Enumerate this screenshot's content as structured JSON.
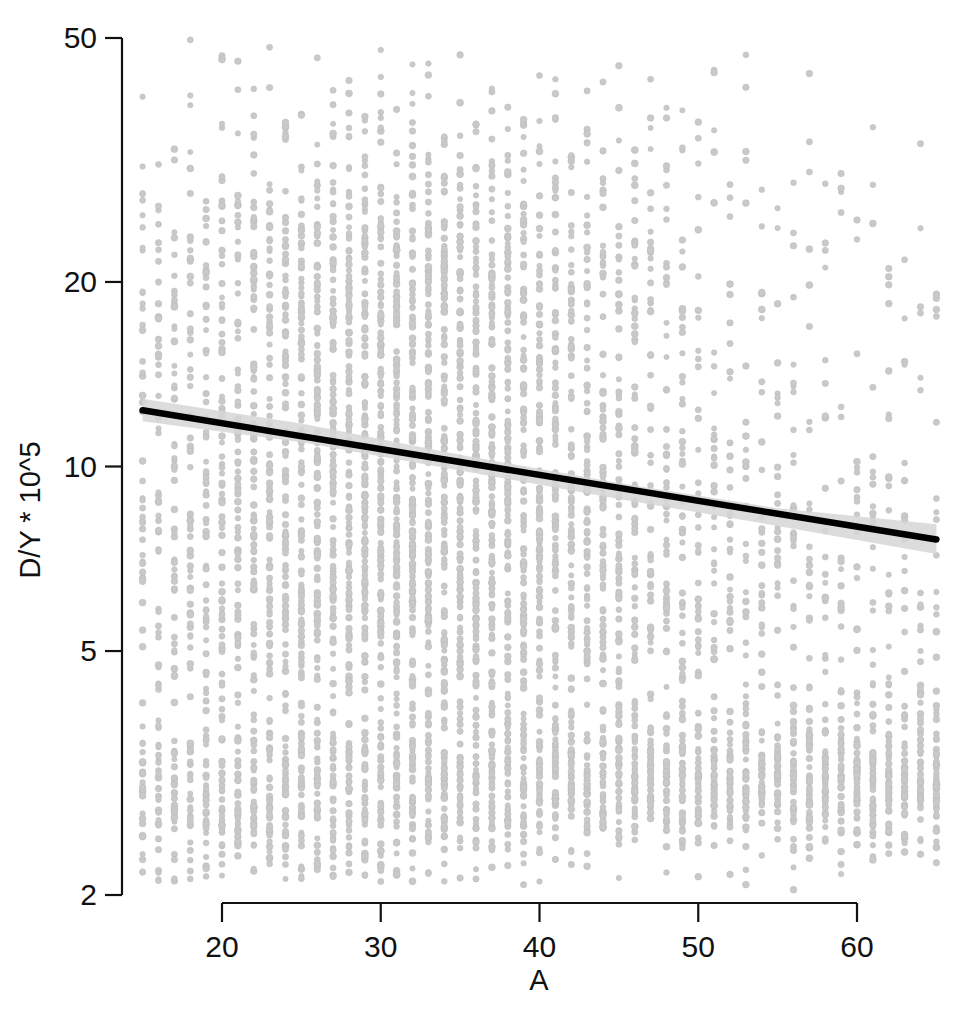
{
  "chart_data": {
    "type": "scatter",
    "title": "",
    "subtitle": "",
    "xlabel": "A",
    "ylabel": "D/Y * 10^5",
    "xscale": "linear",
    "yscale": "log",
    "xlim": [
      14.5,
      65.5
    ],
    "ylim": [
      2,
      50
    ],
    "xticks": [
      20,
      30,
      40,
      50,
      60
    ],
    "xtick_labels": [
      "20",
      "30",
      "40",
      "50",
      "60"
    ],
    "yticks": [
      2,
      5,
      10,
      20,
      50
    ],
    "ytick_labels": [
      "2",
      "5",
      "10",
      "20",
      "50"
    ],
    "grid": false,
    "legend": null,
    "legend_position": "none",
    "annotations": [],
    "marker": {
      "shape": "circle",
      "color": "#c9c9c9",
      "size_px": 3.2,
      "opacity": 0.85,
      "note": "many overlapping light-grey points stacked in vertical columns at integer A values"
    },
    "series": [
      {
        "name": "observations",
        "type": "scatter",
        "n_points_approx": 4200,
        "x_range": [
          15,
          65
        ],
        "y_range": [
          2.1,
          44
        ],
        "description": "Dense cloud of light grey points; strongest concentration between A=28 and A=42 spanning D/Y from about 2.2 to 44, plus a broad horizontal band of points near D/Y = 3 that extends across the whole A range."
      },
      {
        "name": "fit",
        "type": "line",
        "color": "#000000",
        "x": [
          15.0,
          65.0
        ],
        "y": [
          12.35,
          7.6
        ],
        "description": "Black linear fit on the log scale, declining from about 12.4 at A=15 to about 7.6 at A=65."
      },
      {
        "name": "confidence_band",
        "type": "band",
        "color": "#d6d6d6",
        "x": [
          15.0,
          25.0,
          35.0,
          45.0,
          55.0,
          65.0
        ],
        "y_lower": [
          11.85,
          10.95,
          9.85,
          8.85,
          8.0,
          7.2
        ],
        "y_upper": [
          12.9,
          11.75,
          10.45,
          9.4,
          8.55,
          8.05
        ],
        "description": "Narrow light grey ribbon around the fitted line."
      }
    ]
  },
  "figure": {
    "background_color": "#ffffff",
    "axis_color": "#111111",
    "accent_color": "#000000",
    "point_color": "#c9c9c9",
    "band_color": "#d6d6d6"
  },
  "axes": {
    "x_title": "A",
    "y_title": "D/Y * 10^5"
  }
}
